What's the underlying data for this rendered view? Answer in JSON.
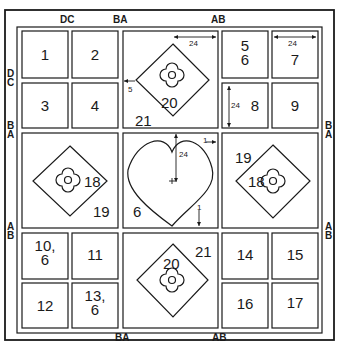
{
  "diagram": {
    "type": "quilt-block-layout",
    "edge_labels": {
      "top": [
        "DC",
        "BA",
        "AB"
      ],
      "bottom": [
        "BA",
        "AB"
      ],
      "left": [
        "D\nC",
        "B\nA",
        "A\nB"
      ],
      "right": [
        "B\nA",
        "A\nB"
      ]
    },
    "cells": {
      "c1": "1",
      "c2": "2",
      "c3": "3",
      "c4": "4",
      "c56": "5\n6",
      "c7": "7",
      "c8": "8",
      "c9": "9",
      "c10": "10,\n6",
      "c11": "11",
      "c12": "12",
      "c13": "13,\n6",
      "c14": "14",
      "c15": "15",
      "c16": "16",
      "c17": "17"
    },
    "large_blocks": {
      "top_center": {
        "diamond": "20",
        "bg": "21",
        "dim_top": "24",
        "dim_left": "5"
      },
      "mid_left": {
        "diamond": "18",
        "bg": "19"
      },
      "center": {
        "heart_bg": "6",
        "dim_vertical": "24",
        "dim_right": "1",
        "dim_bottom": "1"
      },
      "mid_right": {
        "diamond": "18",
        "bg": "19"
      },
      "bottom_center": {
        "diamond": "20",
        "bg": "21"
      }
    },
    "dims": {
      "cell7_top": "24",
      "cell8_left": "24"
    },
    "colors": {
      "line": "#1a1a1a",
      "background": "#ffffff"
    }
  }
}
